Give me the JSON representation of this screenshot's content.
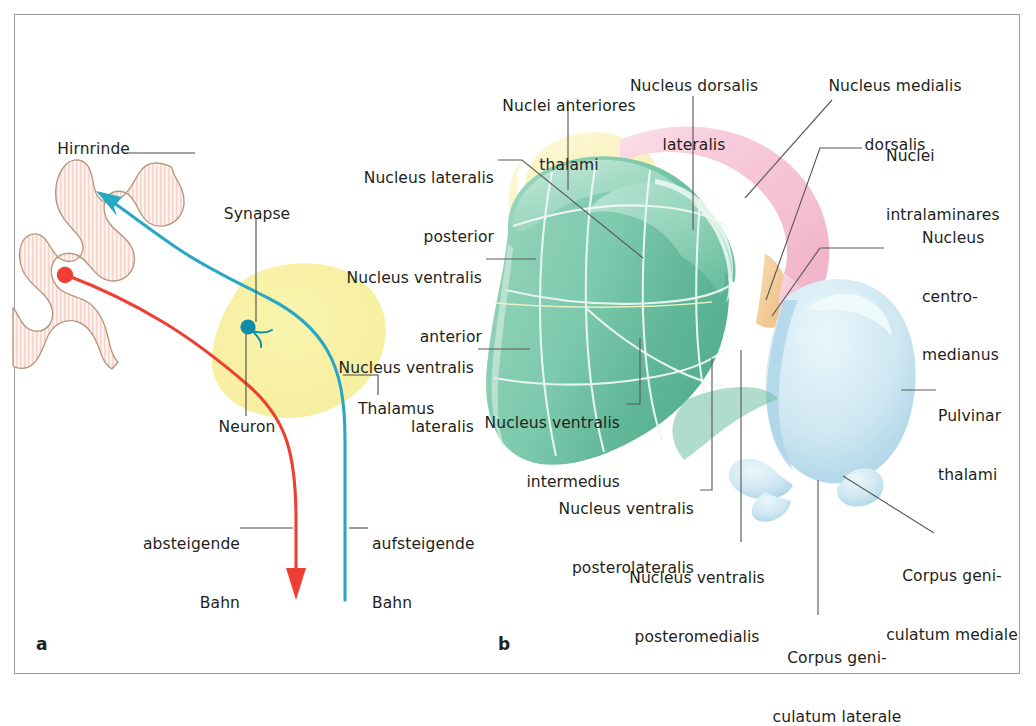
{
  "figure": {
    "background": "#ffffff",
    "frame_color": "#9a9a9a",
    "panels": [
      {
        "letter": "a",
        "name": "schematic-thalamic-relay"
      },
      {
        "letter": "b",
        "name": "thalamic-nuclei-3d"
      }
    ]
  },
  "panel_a": {
    "letter": "a",
    "labels": {
      "hirnrinde": "Hirnrinde",
      "synapse": "Synapse",
      "neuron": "Neuron",
      "thalamus": "Thalamus",
      "absteigende_bahn_line1": "absteigende",
      "absteigende_bahn_line2": "Bahn",
      "aufsteigende_bahn_line1": "aufsteigende",
      "aufsteigende_bahn_line2": "Bahn"
    },
    "colors": {
      "cortex_fill": "#fbeeeb",
      "cortex_hatch": "#f2cfc6",
      "cortex_outline": "#b79a7e",
      "thalamus_blob": "#f7f0a8",
      "ascending_tract": "#29a8c4",
      "descending_tract": "#ef3e33",
      "synapse_node": "#0e8ea6",
      "soma_node": "#ef3e33",
      "leader_line": "#4a4a4a"
    }
  },
  "panel_b": {
    "letter": "b",
    "labels": {
      "nuclei_anteriores_thalami_line1": "Nuclei anteriores",
      "nuclei_anteriores_thalami_line2": "thalami",
      "nucleus_dorsalis_lateralis_line1": "Nucleus dorsalis",
      "nucleus_dorsalis_lateralis_line2": "lateralis",
      "nucleus_medialis_dorsalis_line1": "Nucleus medialis",
      "nucleus_medialis_dorsalis_line2": "dorsalis",
      "nucleus_lateralis_posterior_line1": "Nucleus lateralis",
      "nucleus_lateralis_posterior_line2": "posterior",
      "nuclei_intralaminares_line1": "Nuclei",
      "nuclei_intralaminares_line2": "intralaminares",
      "nucleus_centro_medianus_line1": "Nucleus",
      "nucleus_centro_medianus_line2": "centro-",
      "nucleus_centro_medianus_line3": "medianus",
      "nucleus_ventralis_anterior_line1": "Nucleus ventralis",
      "nucleus_ventralis_anterior_line2": "anterior",
      "nucleus_ventralis_lateralis_line1": "Nucleus ventralis",
      "nucleus_ventralis_lateralis_line2": "lateralis",
      "nucleus_ventralis_intermedius_line1": "Nucleus ventralis",
      "nucleus_ventralis_intermedius_line2": "intermedius",
      "nucleus_ventralis_posterolateralis_line1": "Nucleus ventralis",
      "nucleus_ventralis_posterolateralis_line2": "posterolateralis",
      "nucleus_ventralis_posteromedialis_line1": "Nucleus ventralis",
      "nucleus_ventralis_posteromedialis_line2": "posteromedialis",
      "pulvinar_thalami_line1": "Pulvinar",
      "pulvinar_thalami_line2": "thalami",
      "corpus_geniculatum_mediale_line1": "Corpus geni-",
      "corpus_geniculatum_mediale_line2": "culatum mediale",
      "corpus_geniculatum_laterale_line1": "Corpus geni-",
      "corpus_geniculatum_laterale_line2": "culatum laterale"
    },
    "colors": {
      "ventral_green": "#8fd0b6",
      "ventral_green_dark": "#63b897",
      "ventral_green_light": "#b9e3d2",
      "dorsal_pink": "#f6c6d6",
      "dorsal_pink_light": "#fbdde7",
      "anterior_yellow": "#faf4c0",
      "intralaminar_orange": "#f2c98a",
      "pulvinar_blue": "#cfe7f2",
      "pulvinar_blue_light": "#e6f3f8",
      "pulvinar_blue_dark": "#a8d2e5",
      "surface_line": "#eef8f3",
      "leader_line": "#5a5a5a"
    }
  }
}
